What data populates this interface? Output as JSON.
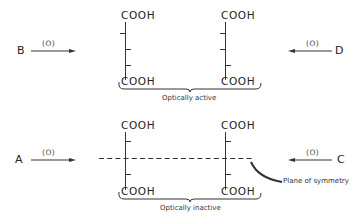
{
  "diagram": {
    "top": {
      "left_molecule": {
        "top_group": "COOH",
        "bottom_group": "COOH"
      },
      "right_molecule": {
        "top_group": "COOH",
        "bottom_group": "COOH"
      },
      "caption": "Optically active",
      "left_reaction": {
        "reactant": "B",
        "reagent": "(O)"
      },
      "right_reaction": {
        "reactant": "D",
        "reagent": "(O)"
      }
    },
    "bottom": {
      "left_molecule": {
        "top_group": "COOH",
        "bottom_group": "COOH"
      },
      "right_molecule": {
        "top_group": "COOH",
        "bottom_group": "COOH"
      },
      "caption": "Optically inactive",
      "left_reaction": {
        "reactant": "A",
        "reagent": "(O)"
      },
      "right_reaction": {
        "reactant": "C",
        "reagent": "(O)"
      },
      "annotation": "Plane of symmetry"
    },
    "colors": {
      "ink": "#222222",
      "background": "#ffffff"
    }
  }
}
